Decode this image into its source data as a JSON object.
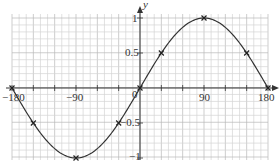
{
  "chart_data": {
    "type": "line",
    "title": "",
    "xlabel": "",
    "ylabel": "y",
    "x": [
      -180,
      -150,
      -90,
      -30,
      0,
      30,
      90,
      150,
      180
    ],
    "series": [
      {
        "name": "y = sin x",
        "values": [
          0,
          -0.5,
          -1,
          -0.5,
          0,
          0.5,
          1,
          0.5,
          0
        ],
        "markers": "x",
        "color": "#333333"
      }
    ],
    "xlim": [
      -180,
      180
    ],
    "ylim": [
      -1,
      1
    ],
    "x_ticks": [
      -180,
      -90,
      0,
      90,
      180
    ],
    "y_ticks": [
      -1,
      -0.5,
      0.5,
      1
    ],
    "x_tick_labels": [
      "-180",
      "-90",
      "0",
      "90",
      "180"
    ],
    "y_tick_labels": [
      "-1",
      "-0.5",
      "0.5",
      "1"
    ],
    "grid": true,
    "legend": "none"
  },
  "labels": {
    "y_axis": "y",
    "x_minus180": "−180",
    "x_minus90": "−90",
    "x_zero": "0",
    "x_90": "90",
    "x_180": "180",
    "y_1": "1",
    "y_0_5": "0.5",
    "y_minus0_5": "−0.5",
    "y_minus1": "−1"
  },
  "colors": {
    "grid_minor": "#d4d4d4",
    "grid_major": "#b8b8b8",
    "axis": "#333333",
    "curve": "#333333"
  }
}
